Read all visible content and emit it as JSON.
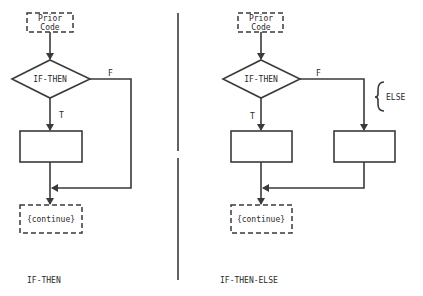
{
  "diagrams": [
    {
      "caption": "IF-THEN",
      "prior_code": [
        "Prior",
        "Code"
      ],
      "decision": "IF-THEN",
      "true_label": "T",
      "false_label": "F",
      "continue": "{continue}"
    },
    {
      "caption": "IF-THEN-ELSE",
      "prior_code": [
        "Prior",
        "Code"
      ],
      "decision": "IF-THEN",
      "true_label": "T",
      "false_label": "F",
      "else_label": "ELSE",
      "continue": "{continue}"
    }
  ],
  "colors": {
    "line": "#3a3a3a",
    "text": "#2a2a2a",
    "background": "#ffffff"
  }
}
